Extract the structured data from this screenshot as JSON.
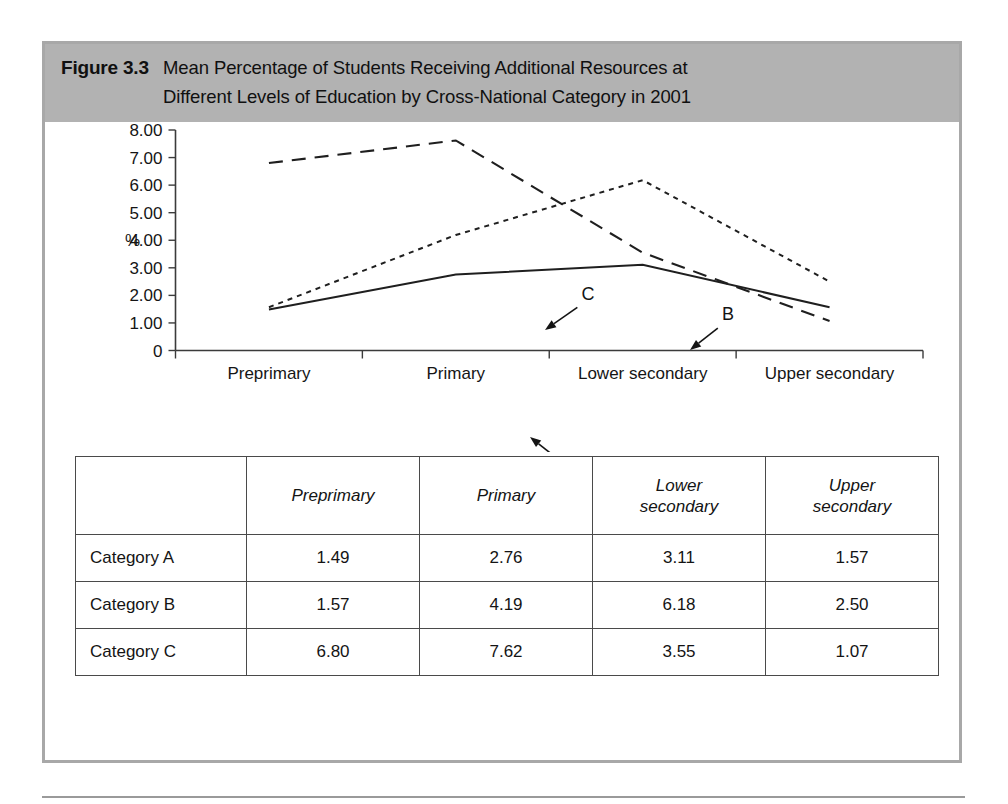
{
  "figure": {
    "number": "Figure 3.3",
    "title_line_1": "Mean Percentage of Students Receiving Additional Resources at",
    "title_line_2": "Different Levels of Education by Cross-National Category in 2001",
    "band_color": "#b2b2b2",
    "border_color": "#a8a8a8"
  },
  "chart_data": {
    "type": "line",
    "title": "Mean Percentage of Students Receiving Additional Resources at Different Levels of Education by Cross-National Category in 2001",
    "xlabel": "",
    "ylabel": "%",
    "categories": [
      "Preprimary",
      "Primary",
      "Lower secondary",
      "Upper secondary"
    ],
    "ylim": [
      0,
      8
    ],
    "ytick_labels": [
      "8.00",
      "7.00",
      "6.00",
      "5.00",
      "4.00",
      "3.00",
      "2.00",
      "1.00",
      "0"
    ],
    "ytick_values": [
      8,
      7,
      6,
      5,
      4,
      3,
      2,
      1,
      0
    ],
    "grid": false,
    "legend": "inline-annotations",
    "series": [
      {
        "name": "A",
        "label": "A",
        "style": "solid",
        "values": [
          1.49,
          2.76,
          3.11,
          1.57
        ]
      },
      {
        "name": "B",
        "label": "B",
        "style": "dotted",
        "values": [
          1.57,
          4.19,
          6.18,
          2.5
        ]
      },
      {
        "name": "C",
        "label": "C",
        "style": "dashed",
        "values": [
          6.8,
          7.62,
          3.55,
          1.07
        ]
      }
    ],
    "annotations": [
      {
        "label": "C",
        "series": "C",
        "text_x": 543,
        "text_y": 178,
        "tip_x": 500,
        "tip_y": 208
      },
      {
        "label": "B",
        "series": "B",
        "text_x": 683,
        "text_y": 198,
        "tip_x": 645,
        "tip_y": 228
      },
      {
        "label": "A",
        "series": "A",
        "text_x": 523,
        "text_y": 345,
        "tip_x": 485,
        "tip_y": 315
      }
    ]
  },
  "table": {
    "corner_header": "",
    "columns": [
      "Preprimary",
      "Primary",
      "Lower\nsecondary",
      "Upper\nsecondary"
    ],
    "column_headers": [
      {
        "line1": "Preprimary",
        "line2": ""
      },
      {
        "line1": "Primary",
        "line2": ""
      },
      {
        "line1": "Lower",
        "line2": "secondary"
      },
      {
        "line1": "Upper",
        "line2": "secondary"
      }
    ],
    "rows": [
      {
        "label": "Category A",
        "values": [
          "1.49",
          "2.76",
          "3.11",
          "1.57"
        ]
      },
      {
        "label": "Category B",
        "values": [
          "1.57",
          "4.19",
          "6.18",
          "2.50"
        ]
      },
      {
        "label": "Category C",
        "values": [
          "6.80",
          "7.62",
          "3.55",
          "1.07"
        ]
      }
    ]
  }
}
